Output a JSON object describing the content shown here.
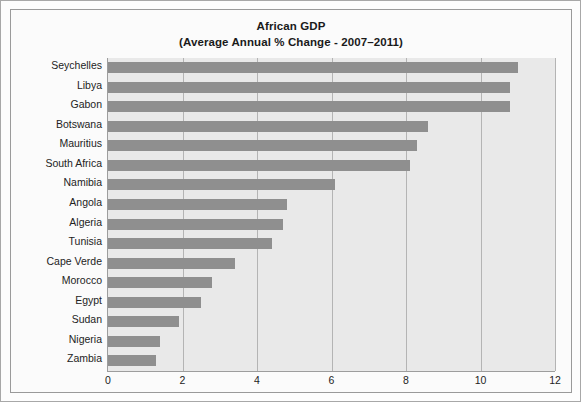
{
  "chart_data": {
    "type": "bar",
    "orientation": "horizontal",
    "title": "African GDP",
    "subtitle": "(Average Annual % Change - 2007–2011)",
    "xlabel": "",
    "ylabel": "",
    "xlim": [
      0,
      12
    ],
    "xticks": [
      0,
      2,
      4,
      6,
      8,
      10,
      12
    ],
    "xtick_labels": [
      "0",
      "2",
      "4",
      "6",
      "8",
      "10",
      "12"
    ],
    "grid": true,
    "legend": false,
    "bar_color": "#8f8f8f",
    "plot_bg_color": "#e9e9e9",
    "categories": [
      "Seychelles",
      "Libya",
      "Gabon",
      "Botswana",
      "Mauritius",
      "South Africa",
      "Namibia",
      "Angola",
      "Algeria",
      "Tunisia",
      "Cape Verde",
      "Morocco",
      "Egypt",
      "Sudan",
      "Nigeria",
      "Zambia"
    ],
    "values": [
      11.0,
      10.8,
      10.8,
      8.6,
      8.3,
      8.1,
      6.1,
      4.8,
      4.7,
      4.4,
      3.4,
      2.8,
      2.5,
      1.9,
      1.4,
      1.3
    ]
  }
}
